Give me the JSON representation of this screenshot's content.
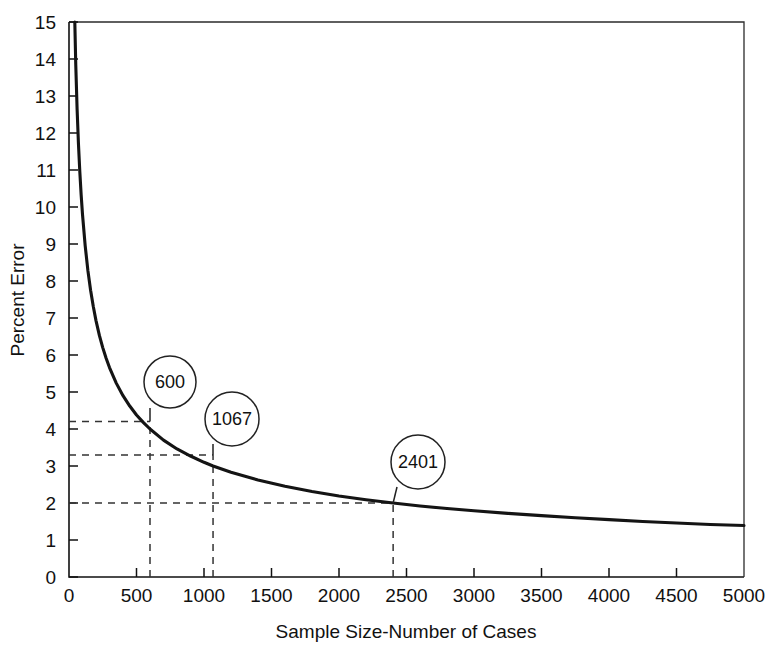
{
  "chart_data": {
    "type": "line",
    "title": "",
    "subtitle": "",
    "xlabel": "Sample Size-Number of Cases",
    "ylabel": "Percent Error",
    "xlim": [
      0,
      5000
    ],
    "ylim": [
      0,
      15
    ],
    "grid": false,
    "legend": null,
    "formula_description": "Percent error = 98 / sqrt(sample size)",
    "x_ticks": [
      0,
      500,
      1000,
      1500,
      2000,
      2500,
      3000,
      3500,
      4000,
      4500,
      5000
    ],
    "x_tick_labels": [
      "0",
      "500",
      "1000",
      "1500",
      "2000",
      "2500",
      "3000",
      "3500",
      "4000",
      "4500",
      "5000"
    ],
    "y_ticks": [
      0,
      1,
      2,
      3,
      4,
      5,
      6,
      7,
      8,
      9,
      10,
      11,
      12,
      13,
      14,
      15
    ],
    "y_tick_labels": [
      "0",
      "1",
      "2",
      "3",
      "4",
      "5",
      "6",
      "7",
      "8",
      "9",
      "10",
      "11",
      "12",
      "13",
      "14",
      "15"
    ],
    "series": [
      {
        "name": "Percent Error",
        "x": [
          43,
          50,
          60,
          70,
          80,
          90,
          100,
          120,
          140,
          160,
          180,
          200,
          225,
          250,
          275,
          300,
          350,
          400,
          450,
          500,
          550,
          600,
          700,
          800,
          900,
          1000,
          1067,
          1200,
          1400,
          1600,
          1800,
          2000,
          2200,
          2401,
          2600,
          2800,
          3000,
          3250,
          3500,
          3750,
          4000,
          4250,
          4500,
          4750,
          5000
        ],
        "y": [
          15.0,
          13.86,
          12.65,
          11.71,
          10.96,
          10.33,
          9.8,
          8.95,
          8.28,
          7.75,
          7.31,
          6.93,
          6.53,
          6.2,
          5.91,
          5.66,
          5.24,
          4.9,
          4.62,
          4.38,
          4.18,
          4.0,
          3.7,
          3.46,
          3.27,
          3.1,
          3.0,
          2.83,
          2.62,
          2.45,
          2.31,
          2.19,
          2.09,
          2.0,
          1.92,
          1.85,
          1.79,
          1.72,
          1.66,
          1.6,
          1.55,
          1.5,
          1.46,
          1.42,
          1.39
        ]
      }
    ],
    "annotations": [
      {
        "label": "600",
        "x": 600,
        "y": 4.2,
        "circle_cx": 170,
        "circle_cy": 382,
        "circle_r": 26,
        "stem_x": 150,
        "stem_y": 408
      },
      {
        "label": "1067",
        "x": 1067,
        "y": 3.3,
        "circle_cx": 232,
        "circle_cy": 419,
        "circle_r": 27,
        "stem_x": 213,
        "stem_y": 444
      },
      {
        "label": "2401",
        "x": 2401,
        "y": 2.0,
        "circle_cx": 418,
        "circle_cy": 462,
        "circle_r": 27,
        "stem_x": 397,
        "stem_y": 487
      }
    ],
    "reference_lines": [
      {
        "kind": "horizontal",
        "value": 4.2,
        "from_x": 0,
        "to_x": 600
      },
      {
        "kind": "horizontal",
        "value": 3.3,
        "from_x": 0,
        "to_x": 1067
      },
      {
        "kind": "horizontal",
        "value": 2.0,
        "from_x": 0,
        "to_x": 2401
      },
      {
        "kind": "vertical",
        "value": 600,
        "from_y": 0,
        "to_y": 4.2
      },
      {
        "kind": "vertical",
        "value": 1067,
        "from_y": 0,
        "to_y": 3.3
      },
      {
        "kind": "vertical",
        "value": 2401,
        "from_y": 0,
        "to_y": 2.0
      }
    ],
    "colors": {
      "curve": "#141414",
      "axis": "#111111",
      "dashed": "#333333",
      "background": "#ffffff",
      "text": "#111111"
    }
  },
  "figure": {
    "width": 773,
    "height": 653,
    "plot_left": 69,
    "plot_right": 744,
    "plot_top": 22,
    "plot_bottom": 577
  }
}
